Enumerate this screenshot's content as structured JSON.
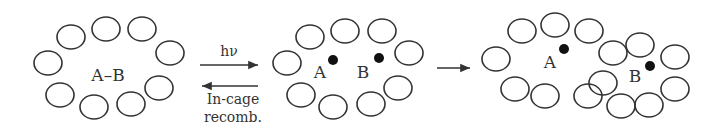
{
  "panels": [
    {
      "label": "A–B",
      "state": "caged pair"
    },
    {
      "label_a": "A",
      "label_b": "B",
      "state": "radical pair in cage"
    },
    {
      "label_a": "A",
      "label_b": "B",
      "state": "escaped radicals"
    }
  ],
  "arrows": {
    "forward_label": "hν",
    "reverse_label_line1": "In-cage",
    "reverse_label_line2": "recomb."
  },
  "colors": {
    "stroke": "#333333",
    "dot": "#111111"
  }
}
